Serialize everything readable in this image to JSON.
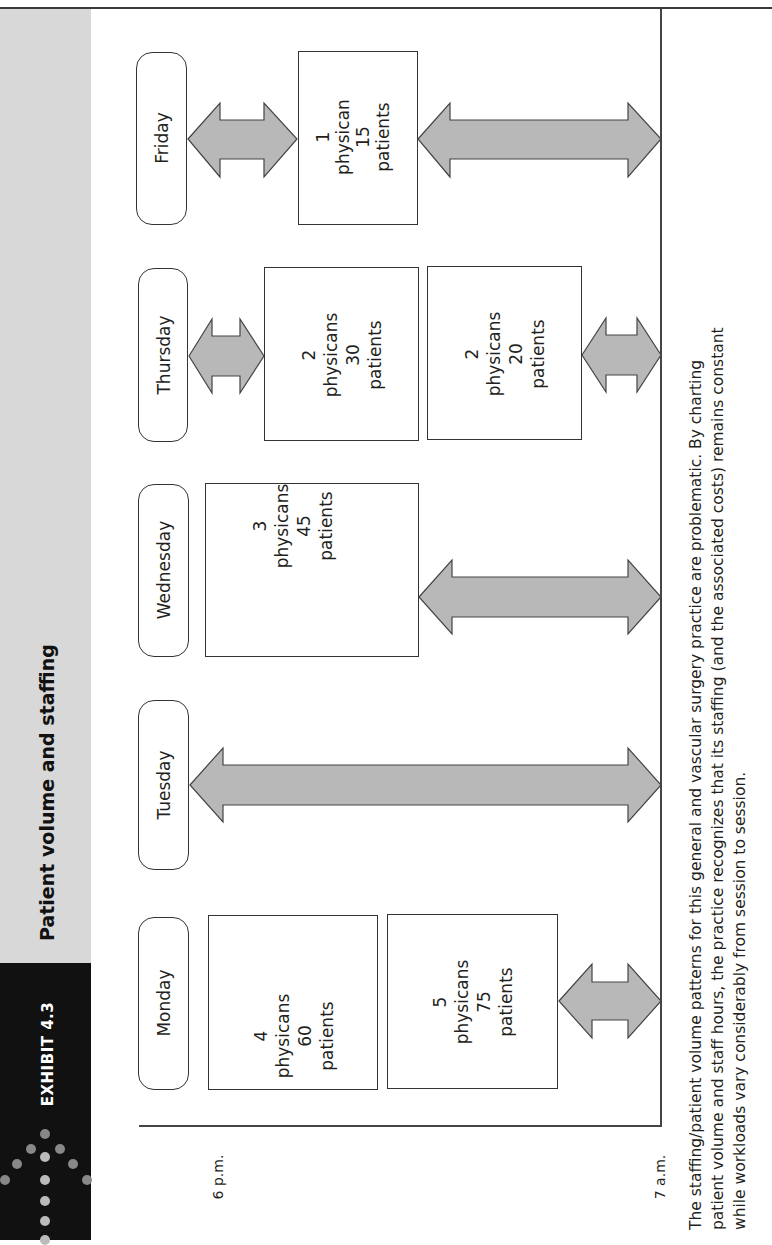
{
  "header": {
    "exhibit_label": "EXHIBIT 4.3",
    "title": "Patient volume and staffing"
  },
  "timeline": {
    "start_label": "6 p.m.",
    "end_label": "7 a.m."
  },
  "days": [
    {
      "name": "Monday",
      "sessions": [
        {
          "physicians": "4",
          "physician_word": "physicans",
          "patients": "60",
          "patient_word": "patients"
        },
        {
          "physicians": "5",
          "physician_word": "physicans",
          "patients": "75",
          "patient_word": "patients"
        }
      ]
    },
    {
      "name": "Tuesday",
      "sessions": []
    },
    {
      "name": "Wednesday",
      "sessions": [
        {
          "physicians": "3",
          "physician_word": "physicans",
          "patients": "45",
          "patient_word": "patients"
        }
      ]
    },
    {
      "name": "Thursday",
      "sessions": [
        {
          "physicians": "2",
          "physician_word": "physicans",
          "patients": "30",
          "patient_word": "patients"
        },
        {
          "physicians": "2",
          "physician_word": "physicans",
          "patients": "20",
          "patient_word": "patients"
        }
      ]
    },
    {
      "name": "Friday",
      "sessions": [
        {
          "physicians": "1",
          "physician_word": "physican",
          "patients": "15",
          "patient_word": "patients"
        }
      ]
    }
  ],
  "caption": {
    "line1": "The staffing/patient volume patterns for this general and vascular surgery practice are problematic. By charting",
    "line2": "patient volume and staff hours, the practice recognizes that its staffing (and the associated costs) remains constant",
    "line3": "while workloads vary considerably from session to session."
  },
  "colors": {
    "header_band": "#d8d8d8",
    "exhibit_block": "#111111",
    "arrow_fill": "#b8b8b8",
    "line": "#333333"
  }
}
